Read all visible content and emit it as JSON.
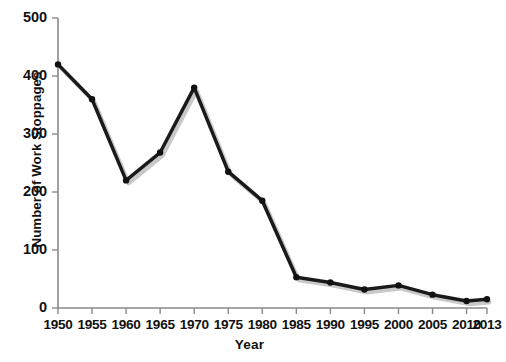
{
  "chart_data": {
    "type": "line",
    "title": "",
    "subtitle": "",
    "xlabel": "Year",
    "ylabel": "Number of Work Stoppages",
    "categories": [
      "1950",
      "1955",
      "1960",
      "1965",
      "1970",
      "1975",
      "1980",
      "1985",
      "1990",
      "1995",
      "2000",
      "2005",
      "2010",
      "2013"
    ],
    "x": [
      1950,
      1955,
      1960,
      1965,
      1970,
      1975,
      1980,
      1985,
      1990,
      1995,
      2000,
      2005,
      2010,
      2013
    ],
    "values": [
      420,
      360,
      220,
      268,
      380,
      235,
      185,
      53,
      44,
      32,
      39,
      23,
      12,
      15
    ],
    "series": [
      {
        "name": "Number of Work Stoppages",
        "values": [
          420,
          360,
          220,
          268,
          380,
          235,
          185,
          53,
          44,
          32,
          39,
          23,
          12,
          15
        ]
      }
    ],
    "xlim": [
      1950,
      2013
    ],
    "ylim": [
      0,
      500
    ],
    "y_ticks": [
      0,
      100,
      200,
      300,
      400,
      500
    ],
    "x_ticks": [
      "1950",
      "1955",
      "1960",
      "1965",
      "1970",
      "1975",
      "1980",
      "1985",
      "1990",
      "1995",
      "2000",
      "2005",
      "2010",
      "2013"
    ],
    "grid": false,
    "legend": false,
    "legend_position": "none",
    "marker": "circle",
    "line_color": "#1a1a1a",
    "marker_color": "#111111",
    "shadow_color": "#c9c9c9",
    "axis_color": "#8a8a8a",
    "background_color": "#ffffff",
    "annotations": []
  },
  "layout": {
    "plot_left": 58,
    "plot_right": 487,
    "plot_top": 18,
    "plot_bottom": 308
  }
}
